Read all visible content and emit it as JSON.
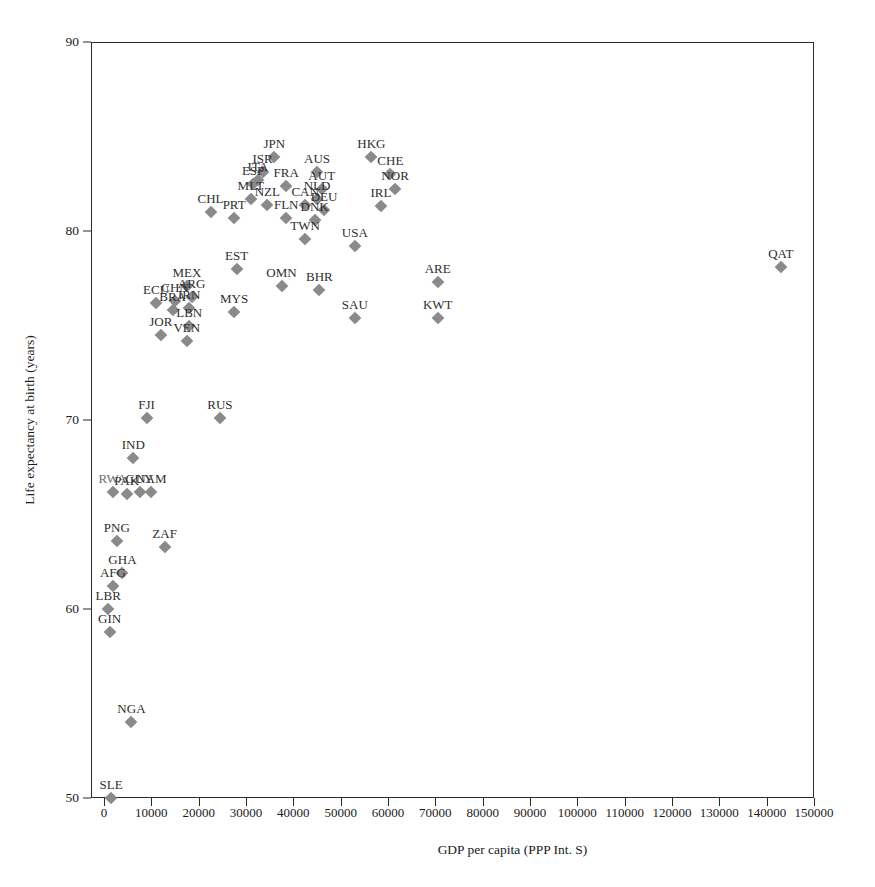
{
  "axes": {
    "x_title": "GDP per capita (PPP Int. S)",
    "y_title": "Life expectancy at birth (years)",
    "x_ticks": [
      "0",
      "10000",
      "20000",
      "30000",
      "40000",
      "50000",
      "60000",
      "70000",
      "80000",
      "90000",
      "100000",
      "110000",
      "120000",
      "130000",
      "140000",
      "150000"
    ],
    "y_ticks": [
      "90",
      "80",
      "70",
      "60",
      "50"
    ]
  },
  "chart_data": {
    "type": "scatter",
    "title": "",
    "xlabel": "GDP per capita (PPP Int. S)",
    "ylabel": "Life expectancy at birth (years)",
    "xlim": [
      0,
      150000
    ],
    "ylim": [
      50,
      90
    ],
    "xtick_values": [
      0,
      10000,
      20000,
      30000,
      40000,
      50000,
      60000,
      70000,
      80000,
      90000,
      100000,
      110000,
      120000,
      130000,
      140000,
      150000
    ],
    "ytick_values": [
      90,
      80,
      70,
      60,
      50
    ],
    "grid": false,
    "legend": null,
    "marker": {
      "shape": "diamond",
      "color": "#8a8a8a",
      "size": 9
    },
    "label_position": "above",
    "points": [
      {
        "label": "JPN",
        "x": 36000,
        "y": 83.9
      },
      {
        "label": "HKG",
        "x": 56500,
        "y": 83.9
      },
      {
        "label": "ISR",
        "x": 33500,
        "y": 83.1
      },
      {
        "label": "AUS",
        "x": 45000,
        "y": 83.1
      },
      {
        "label": "CHE",
        "x": 60500,
        "y": 83.0
      },
      {
        "label": "ITA",
        "x": 32500,
        "y": 82.7
      },
      {
        "label": "ESP",
        "x": 31500,
        "y": 82.5
      },
      {
        "label": "FRA",
        "x": 38500,
        "y": 82.4
      },
      {
        "label": "AUT",
        "x": 46000,
        "y": 82.2
      },
      {
        "label": "NOR",
        "x": 61500,
        "y": 82.2
      },
      {
        "label": "MLT",
        "x": 31000,
        "y": 81.7
      },
      {
        "label": "NLD",
        "x": 45000,
        "y": 81.7
      },
      {
        "label": "CHL",
        "x": 22500,
        "y": 81.0
      },
      {
        "label": "NZL",
        "x": 34500,
        "y": 81.4
      },
      {
        "label": "CAN",
        "x": 42500,
        "y": 81.4
      },
      {
        "label": "IRL",
        "x": 58500,
        "y": 81.3
      },
      {
        "label": "DEU",
        "x": 46500,
        "y": 81.1
      },
      {
        "label": "PRT",
        "x": 27500,
        "y": 80.7
      },
      {
        "label": "FLN",
        "x": 38500,
        "y": 80.7
      },
      {
        "label": "DNK",
        "x": 44500,
        "y": 80.6
      },
      {
        "label": "TWN",
        "x": 42500,
        "y": 79.6
      },
      {
        "label": "USA",
        "x": 53000,
        "y": 79.2
      },
      {
        "label": "EST",
        "x": 28000,
        "y": 78.0
      },
      {
        "label": "QAT",
        "x": 143000,
        "y": 78.1
      },
      {
        "label": "ARE",
        "x": 70500,
        "y": 77.3
      },
      {
        "label": "MEX",
        "x": 17500,
        "y": 77.1
      },
      {
        "label": "OMN",
        "x": 37500,
        "y": 77.1
      },
      {
        "label": "BHR",
        "x": 45500,
        "y": 76.9
      },
      {
        "label": "ARG",
        "x": 18500,
        "y": 76.5
      },
      {
        "label": "CHN",
        "x": 15000,
        "y": 76.3
      },
      {
        "label": "ECU",
        "x": 11000,
        "y": 76.2
      },
      {
        "label": "BRA",
        "x": 14500,
        "y": 75.8
      },
      {
        "label": "IRN",
        "x": 18000,
        "y": 75.9
      },
      {
        "label": "SAU",
        "x": 53000,
        "y": 75.4
      },
      {
        "label": "KWT",
        "x": 70500,
        "y": 75.4
      },
      {
        "label": "MYS",
        "x": 27500,
        "y": 75.7
      },
      {
        "label": "LBN",
        "x": 18000,
        "y": 75.0
      },
      {
        "label": "JOR",
        "x": 12000,
        "y": 74.5
      },
      {
        "label": "VEN",
        "x": 17500,
        "y": 74.2
      },
      {
        "label": "RUS",
        "x": 24500,
        "y": 70.1
      },
      {
        "label": "FJI",
        "x": 9000,
        "y": 70.1
      },
      {
        "label": "IND",
        "x": 6200,
        "y": 68.0
      },
      {
        "label": "GUY",
        "x": 7500,
        "y": 66.2
      },
      {
        "label": "RWA",
        "x": 1800,
        "y": 66.2
      },
      {
        "label": "NAM",
        "x": 10000,
        "y": 66.2
      },
      {
        "label": "PAK",
        "x": 4800,
        "y": 66.1
      },
      {
        "label": "PNG",
        "x": 2700,
        "y": 63.6
      },
      {
        "label": "ZAF",
        "x": 12800,
        "y": 63.3
      },
      {
        "label": "GHA",
        "x": 3900,
        "y": 61.9
      },
      {
        "label": "AFG",
        "x": 1900,
        "y": 61.2
      },
      {
        "label": "LBR",
        "x": 900,
        "y": 60.0
      },
      {
        "label": "GIN",
        "x": 1200,
        "y": 58.8
      },
      {
        "label": "NGA",
        "x": 5800,
        "y": 54.0
      },
      {
        "label": "SLE",
        "x": 1500,
        "y": 50.0
      }
    ]
  },
  "labels": {
    "overlap_note": "RWA"
  }
}
